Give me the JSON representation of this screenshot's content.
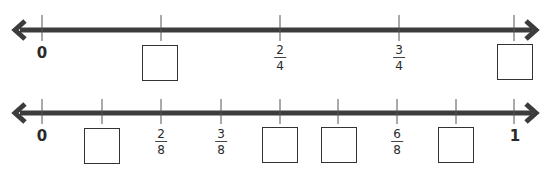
{
  "colors": {
    "line": "#3c3c3c",
    "tick": "#555555",
    "box_border": "#333333",
    "text": "#2a2a2a"
  },
  "number_lines": [
    {
      "id": "fourths",
      "y": 30,
      "x_start": 12,
      "x_end": 540,
      "ticks": [
        {
          "x": 42,
          "type": "whole",
          "label": "0"
        },
        {
          "x": 161,
          "type": "box"
        },
        {
          "x": 280,
          "type": "fraction",
          "num": "2",
          "den": "4"
        },
        {
          "x": 399,
          "type": "fraction",
          "num": "3",
          "den": "4"
        },
        {
          "x": 514,
          "type": "box"
        }
      ]
    },
    {
      "id": "eighths",
      "y": 113,
      "x_start": 12,
      "x_end": 540,
      "ticks": [
        {
          "x": 42,
          "type": "whole",
          "label": "0"
        },
        {
          "x": 102,
          "type": "box"
        },
        {
          "x": 161,
          "type": "fraction",
          "num": "2",
          "den": "8"
        },
        {
          "x": 221,
          "type": "fraction",
          "num": "3",
          "den": "8"
        },
        {
          "x": 280,
          "type": "box"
        },
        {
          "x": 338,
          "type": "box"
        },
        {
          "x": 397,
          "type": "fraction",
          "num": "6",
          "den": "8"
        },
        {
          "x": 456,
          "type": "box"
        },
        {
          "x": 514,
          "type": "whole",
          "label": "1"
        }
      ]
    }
  ]
}
